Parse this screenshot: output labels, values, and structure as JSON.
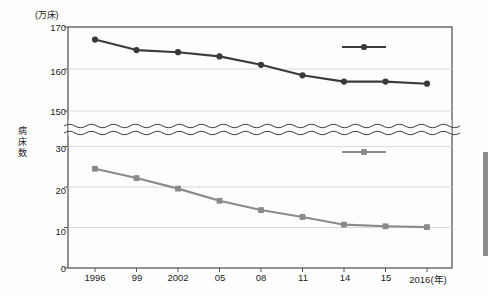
{
  "chart_data": {
    "type": "line",
    "title": "",
    "unit_label": "(万床)",
    "ylabel": "病床数",
    "xlabel": "(年)",
    "x_axis_suffix": "(年)",
    "categories": [
      "1996",
      "99",
      "2002",
      "05",
      "08",
      "11",
      "14",
      "15",
      "2016"
    ],
    "series": [
      {
        "name": "病院",
        "marker": "circle",
        "color": "#3a3a3a",
        "values": [
          167.0,
          164.5,
          164.0,
          163.0,
          161.0,
          158.5,
          157.0,
          157.0,
          156.5
        ]
      },
      {
        "name": "一般診療所",
        "marker": "square",
        "color": "#8a8a8a",
        "values": [
          24.5,
          22.2,
          19.6,
          16.6,
          14.3,
          12.6,
          10.7,
          10.3,
          10.1
        ]
      }
    ],
    "y_axis": {
      "upper_ticks": [
        170,
        160,
        150
      ],
      "lower_ticks": [
        30,
        20,
        10,
        0
      ],
      "broken": true,
      "break_style": "double-wave"
    },
    "grid": true,
    "legend_position": "inside-right"
  },
  "labels": {
    "unit": "(万床)",
    "y_title_chars": [
      "病",
      "床",
      "数"
    ],
    "y_ticks_upper": [
      "170",
      "160",
      "150"
    ],
    "y_ticks_lower": [
      "30",
      "20",
      "10",
      "0"
    ],
    "x_ticks": [
      "1996",
      "99",
      "2002",
      "05",
      "08",
      "11",
      "14",
      "15",
      "2016(年)"
    ],
    "legend_hospital": "病院",
    "legend_clinic": "一般診療所"
  }
}
